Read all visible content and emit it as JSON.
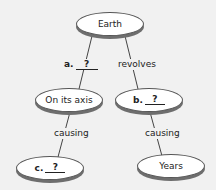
{
  "diagram": {
    "type": "concept-map",
    "colors": {
      "background": "#f1f1f1",
      "node_fill": "#ffffff",
      "node_border": "#555555",
      "node_shadow": "#6e6e6e",
      "line": "#444444",
      "text": "#222222"
    },
    "nodes": {
      "root": {
        "label": "Earth"
      },
      "left_mid": {
        "label": "On its axis"
      },
      "right_mid": {
        "letter": "b.",
        "blank": "?"
      },
      "left_bottom": {
        "letter": "c.",
        "blank": "?"
      },
      "right_bottom": {
        "label": "Years"
      }
    },
    "links": {
      "root_left": {
        "letter": "a.",
        "blank": "?"
      },
      "root_right": {
        "label": "revolves"
      },
      "left_down": {
        "label": "causing"
      },
      "right_down": {
        "label": "causing"
      }
    }
  }
}
